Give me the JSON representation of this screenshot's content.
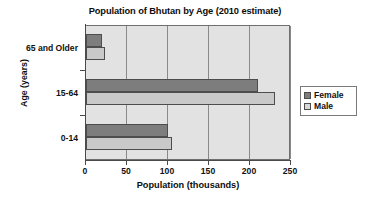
{
  "chart_data": {
    "type": "bar",
    "orientation": "horizontal",
    "title": "Population of Bhutan by Age (2010 estimate)",
    "xlabel": "Population (thousands)",
    "ylabel": "Age (years)",
    "categories": [
      "0-14",
      "15-64",
      "65 and Older"
    ],
    "series": [
      {
        "name": "Female",
        "color": "#7d7d7d",
        "values": [
          100,
          210,
          19
        ]
      },
      {
        "name": "Male",
        "color": "#c9c9c9",
        "values": [
          105,
          231,
          23
        ]
      }
    ],
    "xlim": [
      0,
      250
    ],
    "xticks": [
      0,
      50,
      100,
      150,
      200,
      250
    ],
    "xtick_labels": [
      "0",
      "50",
      "100",
      "150",
      "200",
      "250"
    ],
    "grid": "vertical",
    "legend_position": "right",
    "plot_background": "#e2e2e2",
    "figure_background": "#ffffff"
  },
  "legend": {
    "items": [
      {
        "label": "Female",
        "swatch": "female-swatch-icon"
      },
      {
        "label": "Male",
        "swatch": "male-swatch-icon"
      }
    ]
  }
}
